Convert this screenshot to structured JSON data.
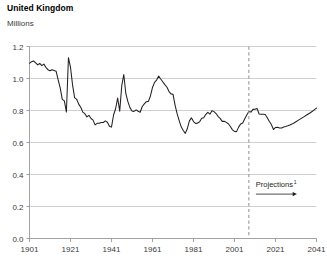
{
  "header": {
    "title": "United Kingdom",
    "subtitle": "Millions"
  },
  "annotations": {
    "projections_label": "Projections",
    "projections_footnote": "1"
  },
  "colors": {
    "line": "#231f20",
    "grid": "#bcbcbc",
    "axis": "#8c8c8c",
    "divider": "#9a9a9a",
    "text": "#3b3b3b",
    "title": "#000000",
    "background": "#ffffff"
  },
  "chart_data": {
    "type": "line",
    "title": "United Kingdom",
    "subtitle": "Millions",
    "xlabel": "",
    "ylabel": "Millions",
    "xlim": [
      1901,
      2041
    ],
    "ylim": [
      0.0,
      1.2
    ],
    "yticks": [
      0.0,
      0.2,
      0.4,
      0.6,
      0.8,
      1.0,
      1.2
    ],
    "ytick_labels": [
      "0.0",
      "0.2",
      "0.4",
      "0.6",
      "0.8",
      "1.0",
      "1.2"
    ],
    "xticks": [
      1901,
      1921,
      1941,
      1961,
      1981,
      2001,
      2021,
      2041
    ],
    "xtick_labels": [
      "1901",
      "1921",
      "1941",
      "1961",
      "1981",
      "2001",
      "2021",
      "2041"
    ],
    "grid": true,
    "legend": "none",
    "projection_start_year": 2008,
    "annotations": [
      {
        "text": "Projections",
        "footnote": "1",
        "type": "vertical-dashed-divider-with-arrow",
        "x": 2008,
        "arrow_from_year": 2009,
        "arrow_to_year": 2029,
        "y_value": 0.34
      }
    ],
    "series": [
      {
        "name": "Births",
        "x": [
          1901,
          1902,
          1903,
          1904,
          1905,
          1906,
          1907,
          1908,
          1909,
          1910,
          1911,
          1912,
          1913,
          1914,
          1915,
          1916,
          1917,
          1918,
          1919,
          1920,
          1921,
          1922,
          1923,
          1924,
          1925,
          1926,
          1927,
          1928,
          1929,
          1930,
          1931,
          1932,
          1933,
          1934,
          1935,
          1936,
          1937,
          1938,
          1939,
          1940,
          1941,
          1942,
          1943,
          1944,
          1945,
          1946,
          1947,
          1948,
          1949,
          1950,
          1951,
          1952,
          1953,
          1954,
          1955,
          1956,
          1957,
          1958,
          1959,
          1960,
          1961,
          1962,
          1963,
          1964,
          1965,
          1966,
          1967,
          1968,
          1969,
          1970,
          1971,
          1972,
          1973,
          1974,
          1975,
          1976,
          1977,
          1978,
          1979,
          1980,
          1981,
          1982,
          1983,
          1984,
          1985,
          1986,
          1987,
          1988,
          1989,
          1990,
          1991,
          1992,
          1993,
          1994,
          1995,
          1996,
          1997,
          1998,
          1999,
          2000,
          2001,
          2002,
          2003,
          2004,
          2005,
          2006,
          2007,
          2008,
          2009,
          2010,
          2011,
          2012,
          2013,
          2014,
          2015,
          2016,
          2017,
          2018,
          2019,
          2020,
          2021,
          2022,
          2023,
          2024,
          2025,
          2026,
          2027,
          2028,
          2029,
          2030,
          2031,
          2032,
          2033,
          2034,
          2035,
          2036,
          2037,
          2038,
          2039,
          2040,
          2041
        ],
        "y": [
          1.095,
          1.105,
          1.11,
          1.098,
          1.085,
          1.095,
          1.08,
          1.09,
          1.07,
          1.055,
          1.048,
          1.055,
          1.05,
          1.045,
          0.99,
          0.94,
          0.87,
          0.86,
          0.79,
          1.13,
          1.07,
          0.96,
          0.88,
          0.87,
          0.84,
          0.82,
          0.79,
          0.78,
          0.76,
          0.77,
          0.75,
          0.74,
          0.71,
          0.72,
          0.72,
          0.725,
          0.725,
          0.735,
          0.727,
          0.702,
          0.696,
          0.772,
          0.811,
          0.878,
          0.796,
          0.955,
          1.025,
          0.905,
          0.855,
          0.818,
          0.797,
          0.794,
          0.804,
          0.795,
          0.789,
          0.825,
          0.841,
          0.855,
          0.857,
          0.891,
          0.944,
          0.976,
          0.99,
          1.015,
          0.997,
          0.98,
          0.962,
          0.947,
          0.92,
          0.904,
          0.902,
          0.834,
          0.78,
          0.737,
          0.698,
          0.675,
          0.657,
          0.687,
          0.735,
          0.754,
          0.731,
          0.719,
          0.721,
          0.73,
          0.751,
          0.755,
          0.776,
          0.788,
          0.777,
          0.799,
          0.793,
          0.781,
          0.762,
          0.751,
          0.732,
          0.733,
          0.726,
          0.717,
          0.7,
          0.679,
          0.669,
          0.668,
          0.696,
          0.716,
          0.722,
          0.748,
          0.772,
          0.794,
          0.79,
          0.807,
          0.808,
          0.813,
          0.778,
          0.776,
          0.777,
          0.775,
          0.755,
          0.731,
          0.712,
          0.681,
          0.694,
          0.695,
          0.69,
          0.691,
          0.697,
          0.7,
          0.704,
          0.709,
          0.715,
          0.722,
          0.73,
          0.738,
          0.746,
          0.754,
          0.762,
          0.77,
          0.778,
          0.786,
          0.795,
          0.805,
          0.815
        ]
      }
    ]
  }
}
